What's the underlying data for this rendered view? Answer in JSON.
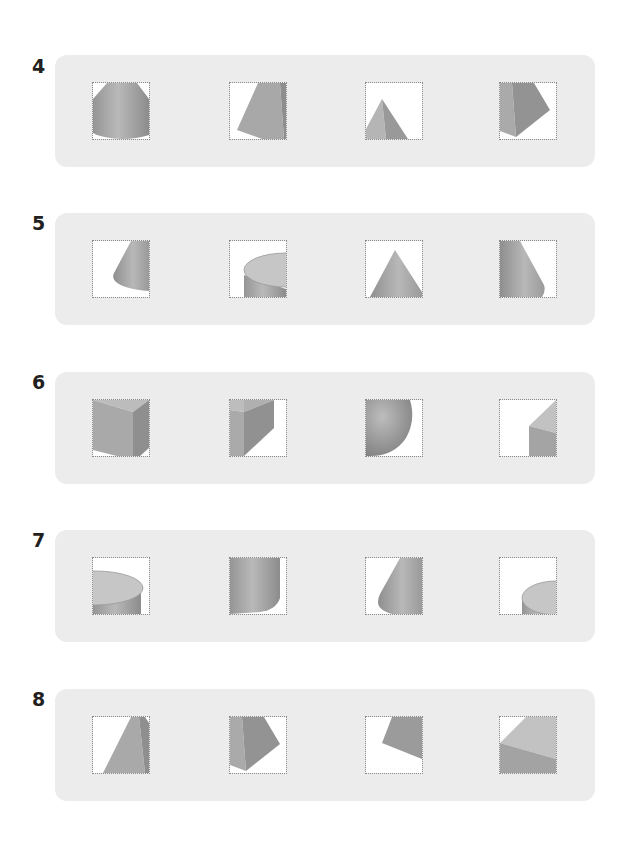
{
  "questions": [
    {
      "number": "4",
      "options": [
        {
          "id": "a",
          "shape": "truncated-cone-frustum-view"
        },
        {
          "id": "b",
          "shape": "cropped-pyramid-slant-view"
        },
        {
          "id": "c",
          "shape": "triangular-pyramid-view"
        },
        {
          "id": "d",
          "shape": "pyramid-side-pentagon-view"
        }
      ]
    },
    {
      "number": "5",
      "options": [
        {
          "id": "a",
          "shape": "cone-side-crop-view"
        },
        {
          "id": "b",
          "shape": "cylinder-top-crop-view"
        },
        {
          "id": "c",
          "shape": "cone-front-view"
        },
        {
          "id": "d",
          "shape": "cone-left-crop-view"
        }
      ]
    },
    {
      "number": "6",
      "options": [
        {
          "id": "a",
          "shape": "cuboid-corner-view"
        },
        {
          "id": "b",
          "shape": "cuboid-edge-view"
        },
        {
          "id": "c",
          "shape": "sphere-crop-view"
        },
        {
          "id": "d",
          "shape": "cuboid-small-corner-view"
        }
      ]
    },
    {
      "number": "7",
      "options": [
        {
          "id": "a",
          "shape": "cylinder-top-left-view"
        },
        {
          "id": "b",
          "shape": "cylinder-side-view"
        },
        {
          "id": "c",
          "shape": "cone-side-crop-view"
        },
        {
          "id": "d",
          "shape": "cylinder-small-corner-view"
        }
      ]
    },
    {
      "number": "8",
      "options": [
        {
          "id": "a",
          "shape": "pyramid-slant-crop-view"
        },
        {
          "id": "b",
          "shape": "pyramid-pentagon-view"
        },
        {
          "id": "c",
          "shape": "pyramid-face-crop-view"
        },
        {
          "id": "d",
          "shape": "cuboid-corner-crop-view"
        }
      ]
    }
  ],
  "colors": {
    "card_bg": "#ececec",
    "shape_light": "#c8c8c8",
    "shape_mid": "#a9a9a9",
    "shape_dark": "#8e8e8e",
    "number_text": "#231f20"
  }
}
